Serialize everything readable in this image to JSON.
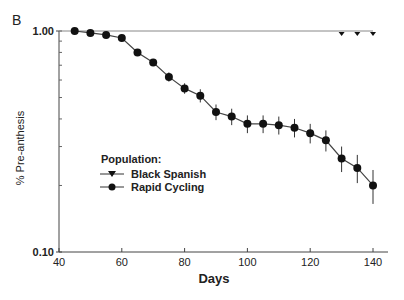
{
  "panel_label": "B",
  "chart_data": {
    "type": "line",
    "title": "",
    "xlabel": "Days",
    "ylabel": "% Pre-anthesis",
    "xlim": [
      40,
      145
    ],
    "ylim": [
      0.1,
      1.0
    ],
    "yscale": "log",
    "grid": false,
    "x_ticks": [
      40,
      60,
      80,
      100,
      120,
      140
    ],
    "y_ticks": [
      "0.10",
      "1.00"
    ],
    "y_minor_ticks": [
      0.2,
      0.3,
      0.4,
      0.5,
      0.6,
      0.7,
      0.8,
      0.9
    ],
    "legend": {
      "title": "Population:",
      "position": "center-left",
      "entries": [
        "Black Spanish",
        "Rapid Cycling"
      ]
    },
    "series": [
      {
        "name": "Black Spanish",
        "marker": "triangle-down",
        "x": [
          40,
          130,
          135,
          140
        ],
        "values": [
          1.0,
          1.0,
          1.0,
          1.0
        ],
        "marker_x": [
          130,
          135,
          140
        ]
      },
      {
        "name": "Rapid Cycling",
        "marker": "circle",
        "x": [
          45,
          50,
          55,
          60,
          65,
          70,
          75,
          80,
          85,
          90,
          95,
          100,
          105,
          110,
          115,
          120,
          125,
          130,
          135,
          140
        ],
        "values": [
          1.0,
          0.98,
          0.96,
          0.93,
          0.8,
          0.72,
          0.62,
          0.55,
          0.51,
          0.43,
          0.41,
          0.38,
          0.38,
          0.375,
          0.365,
          0.345,
          0.32,
          0.265,
          0.24,
          0.2
        ],
        "error": [
          0,
          0.005,
          0.005,
          0.008,
          0.02,
          0.025,
          0.03,
          0.03,
          0.035,
          0.035,
          0.035,
          0.035,
          0.035,
          0.035,
          0.035,
          0.035,
          0.035,
          0.035,
          0.035,
          0.035
        ]
      }
    ]
  }
}
